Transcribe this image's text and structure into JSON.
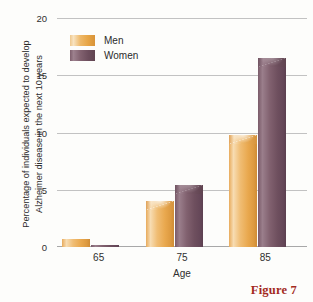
{
  "chart_data": {
    "type": "bar",
    "title": "",
    "categories": [
      "65",
      "75",
      "85"
    ],
    "series": [
      {
        "name": "Men",
        "color": "#e9a84e",
        "values": [
          0.7,
          4.0,
          9.8
        ]
      },
      {
        "name": "Women",
        "color": "#6e4f5e",
        "values": [
          0.2,
          5.4,
          16.5
        ]
      }
    ],
    "xlabel": "Age",
    "ylabel": "Percentage of individuals expected to develop Alzheimer disease in the next 10 years",
    "ylabel_line1": "Percentage of individuals expected to develop",
    "ylabel_line2": "Alzheimer disease in the next 10 years",
    "ylim": [
      0,
      20
    ],
    "yticks": [
      "0",
      "5",
      "10",
      "15",
      "20"
    ],
    "ytick_values": [
      0,
      5,
      10,
      15,
      20
    ],
    "grid": true,
    "legend_position": "top-left"
  },
  "legend": {
    "items": [
      {
        "label": "Men",
        "color": "#e9a84e"
      },
      {
        "label": "Women",
        "color": "#6e4f5e"
      }
    ]
  },
  "caption": {
    "text": "Figure 7",
    "color": "#a32a1e"
  }
}
